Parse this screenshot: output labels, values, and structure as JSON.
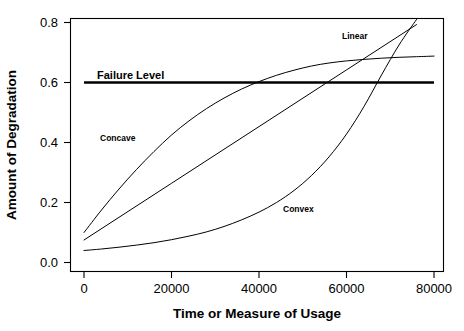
{
  "chart_data": {
    "type": "line",
    "title": "",
    "xlabel": "Time or Measure of Usage",
    "ylabel": "Amount of Degradation",
    "xlim": [
      -2000,
      82000
    ],
    "ylim": [
      0.0,
      0.835
    ],
    "grid": false,
    "legend": "inline-labels",
    "xticks": [
      0,
      20000,
      40000,
      60000,
      80000
    ],
    "xtick_labels": [
      "0",
      "20000",
      "40000",
      "60000",
      "80000"
    ],
    "yticks": [
      0.0,
      0.2,
      0.4,
      0.6,
      0.8
    ],
    "ytick_labels": [
      "0.0",
      "0.2",
      "0.4",
      "0.6",
      "0.8"
    ],
    "annotations": [
      {
        "text": "Failure Level",
        "x": 3000,
        "y": 0.645
      },
      {
        "text": "Concave",
        "x": 4500,
        "y": 0.425
      },
      {
        "text": "Linear",
        "x": 61000,
        "y": 0.775
      },
      {
        "text": "Convex",
        "x": 47500,
        "y": 0.2
      }
    ],
    "threshold": {
      "name": "Failure Level",
      "value": 0.6,
      "x_start": 0,
      "x_end": 80000
    },
    "series": [
      {
        "name": "Concave",
        "x": [
          0,
          4000,
          8000,
          12000,
          16000,
          20000,
          24000,
          28000,
          32000,
          36000,
          40000,
          44000,
          48000,
          52000,
          56000,
          60000,
          64000,
          68000,
          72000,
          76000,
          80000
        ],
        "y": [
          0.1,
          0.175,
          0.245,
          0.31,
          0.37,
          0.425,
          0.472,
          0.513,
          0.548,
          0.578,
          0.603,
          0.624,
          0.641,
          0.655,
          0.665,
          0.672,
          0.677,
          0.681,
          0.684,
          0.686,
          0.688
        ]
      },
      {
        "name": "Linear",
        "x": [
          0,
          20000,
          40000,
          60000,
          76000
        ],
        "y": [
          0.075,
          0.264,
          0.453,
          0.642,
          0.793
        ]
      },
      {
        "name": "Convex",
        "x": [
          0,
          4000,
          8000,
          12000,
          16000,
          20000,
          24000,
          28000,
          32000,
          36000,
          40000,
          44000,
          48000,
          52000,
          56000,
          60000,
          64000,
          68000,
          72000,
          76000
        ],
        "y": [
          0.04,
          0.045,
          0.051,
          0.058,
          0.066,
          0.076,
          0.088,
          0.102,
          0.12,
          0.142,
          0.168,
          0.2,
          0.24,
          0.29,
          0.352,
          0.428,
          0.52,
          0.625,
          0.725,
          0.81
        ]
      }
    ]
  }
}
